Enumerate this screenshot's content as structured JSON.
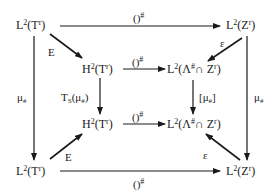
{
  "diagram": {
    "type": "commutative-diagram",
    "nodes": {
      "top_left": {
        "base": "L",
        "exp": "2",
        "arg": "(T",
        "arg_sup": "r",
        "close": ")"
      },
      "top_right": {
        "base": "L",
        "exp": "2",
        "arg": "(Z",
        "arg_sup": "r",
        "close": ")"
      },
      "inner_top_left": {
        "base": "H",
        "exp": "2",
        "arg": "(T",
        "arg_sup": "r",
        "close": ")"
      },
      "inner_top_right": {
        "base": "L",
        "exp": "2",
        "arg": "(Λ",
        "arg_sup": "#",
        "mid": "∩ Z",
        "mid_sup": "r",
        "close": ")"
      },
      "inner_bottom_left": {
        "base": "H",
        "exp": "2",
        "arg": "(T",
        "arg_sup": "r",
        "close": ")"
      },
      "inner_bottom_right": {
        "base": "L",
        "exp": "2",
        "arg": "(Λ",
        "arg_sup": "#",
        "mid": "∩ Z",
        "mid_sup": "r",
        "close": ")"
      },
      "bottom_left": {
        "base": "L",
        "exp": "2",
        "arg": "(T",
        "arg_sup": "r",
        "close": ")"
      },
      "bottom_right": {
        "base": "L",
        "exp": "2",
        "arg": "(Z",
        "arg_sup": "r",
        "close": ")"
      }
    },
    "arrows": {
      "top": {
        "label": "()",
        "sup": "#"
      },
      "bottom": {
        "label": "()",
        "sup": "#"
      },
      "inner_top": {
        "label": "()",
        "sup": "#"
      },
      "inner_bottom": {
        "label": "()",
        "sup": "#"
      },
      "left": {
        "label": "μ",
        "sub": "#"
      },
      "right": {
        "label": "μ",
        "sub": "#"
      },
      "inner_left": {
        "label": "T",
        "sub": "S",
        "tail": "(μ",
        "tail_sub": "#",
        "close": ")"
      },
      "inner_right": {
        "label": "[μ",
        "sub": "#",
        "close": "]"
      },
      "diag_top_left": {
        "label": "E"
      },
      "diag_bottom_left": {
        "label": "E"
      },
      "diag_top_right": {
        "label": "ε"
      },
      "diag_bottom_right": {
        "label": "ε"
      }
    }
  }
}
